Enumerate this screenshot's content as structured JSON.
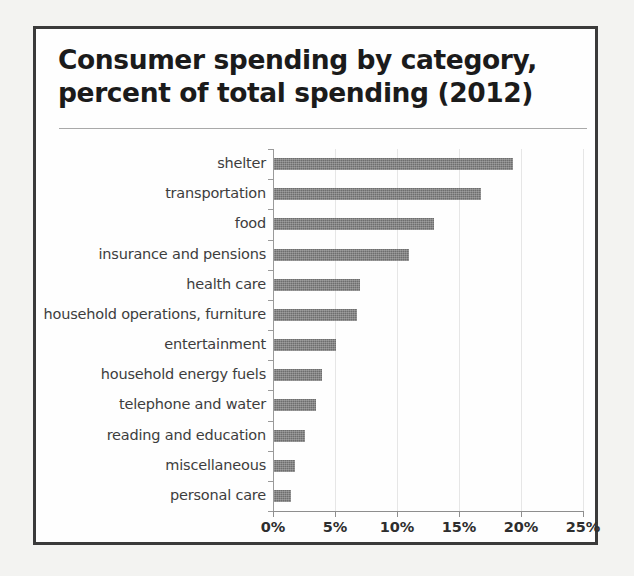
{
  "figure": {
    "title_line1": "Consumer spending by category,",
    "title_line2": "percent of total spending (2012)",
    "frame_color": "#3a3a3a",
    "bar_color": "#6e6e6e",
    "background": "#ffffff",
    "page_background": "#f3f3f1"
  },
  "chart_data": {
    "type": "bar",
    "orientation": "horizontal",
    "title": "Consumer spending by category, percent of total spending (2012)",
    "xlabel": "",
    "ylabel": "",
    "xlim": [
      0,
      25
    ],
    "grid": true,
    "legend": null,
    "unit": "percent of total spending",
    "year": 2012,
    "xticks": [
      0,
      5,
      10,
      15,
      20,
      25
    ],
    "xtick_labels": [
      "0%",
      "5%",
      "10%",
      "15%",
      "20%",
      "25%"
    ],
    "categories": [
      "shelter",
      "transportation",
      "food",
      "insurance and pensions",
      "health care",
      "household operations, furniture",
      "entertainment",
      "household energy fuels",
      "telephone and water",
      "reading and education",
      "miscellaneous",
      "personal care"
    ],
    "values": [
      19.3,
      16.7,
      12.9,
      10.9,
      6.9,
      6.7,
      5.0,
      3.9,
      3.4,
      2.5,
      1.7,
      1.4
    ],
    "value_labels": [
      "19.3%",
      "16.7%",
      "12.9%",
      "10.9%",
      "6.9%",
      "6.7%",
      "5.0%",
      "3.9%",
      "3.4%",
      "2.5%",
      "1.7%",
      "1.4%"
    ]
  }
}
